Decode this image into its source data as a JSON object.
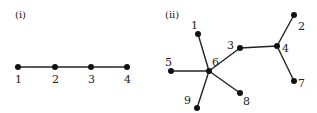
{
  "panels": [
    {
      "label": "(i)",
      "nodes": [
        {
          "id": "1",
          "label": "1"
        },
        {
          "id": "2",
          "label": "2"
        },
        {
          "id": "3",
          "label": "3"
        },
        {
          "id": "4",
          "label": "4"
        }
      ],
      "edges": [
        [
          "1",
          "2"
        ],
        [
          "2",
          "3"
        ],
        [
          "3",
          "4"
        ]
      ]
    },
    {
      "label": "(ii)",
      "nodes": [
        {
          "id": "1",
          "label": "1"
        },
        {
          "id": "2",
          "label": "2"
        },
        {
          "id": "3",
          "label": "3"
        },
        {
          "id": "4",
          "label": "4"
        },
        {
          "id": "5",
          "label": "5"
        },
        {
          "id": "6",
          "label": "6"
        },
        {
          "id": "7",
          "label": "7"
        },
        {
          "id": "8",
          "label": "8"
        },
        {
          "id": "9",
          "label": "9"
        }
      ],
      "edges": [
        [
          "1",
          "6"
        ],
        [
          "5",
          "6"
        ],
        [
          "9",
          "6"
        ],
        [
          "8",
          "6"
        ],
        [
          "3",
          "6"
        ],
        [
          "3",
          "4"
        ],
        [
          "2",
          "4"
        ],
        [
          "7",
          "4"
        ]
      ]
    }
  ]
}
